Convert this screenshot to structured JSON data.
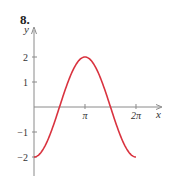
{
  "problem_number": "8.",
  "chart_data": {
    "type": "line",
    "title": "",
    "function": "y = -2 cos(x)",
    "xlabel": "x",
    "ylabel": "y",
    "x_ticks": [
      {
        "value": 3.14159,
        "label": "π"
      },
      {
        "value": 6.28318,
        "label": "2π"
      }
    ],
    "y_ticks": [
      {
        "value": 2,
        "label": "2"
      },
      {
        "value": 1,
        "label": "1"
      },
      {
        "value": -1,
        "label": "−1"
      },
      {
        "value": -2,
        "label": "−2"
      }
    ],
    "xlim": [
      0,
      6.9
    ],
    "ylim": [
      -2.7,
      3.1
    ],
    "grid": false,
    "series": [
      {
        "name": "curve",
        "color": "#d9333f",
        "x": [
          0,
          0.785,
          1.571,
          2.356,
          3.142,
          3.927,
          4.712,
          5.498,
          6.283
        ],
        "y": [
          -2,
          -1.414,
          0,
          1.414,
          2,
          1.414,
          0,
          -1.414,
          -2
        ]
      }
    ]
  }
}
